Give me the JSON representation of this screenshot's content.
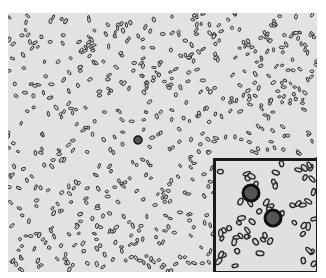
{
  "image": {
    "description": "Brightfield microscopy field of many small rod/oval particles with two large dark spheres; magnified inset in lower-right corner",
    "background_color": "#e2e2e2",
    "particle_color": "#2a2a2a",
    "inset_border_color": "#1a1a1a"
  },
  "inset": {
    "label": "magnified-region"
  }
}
